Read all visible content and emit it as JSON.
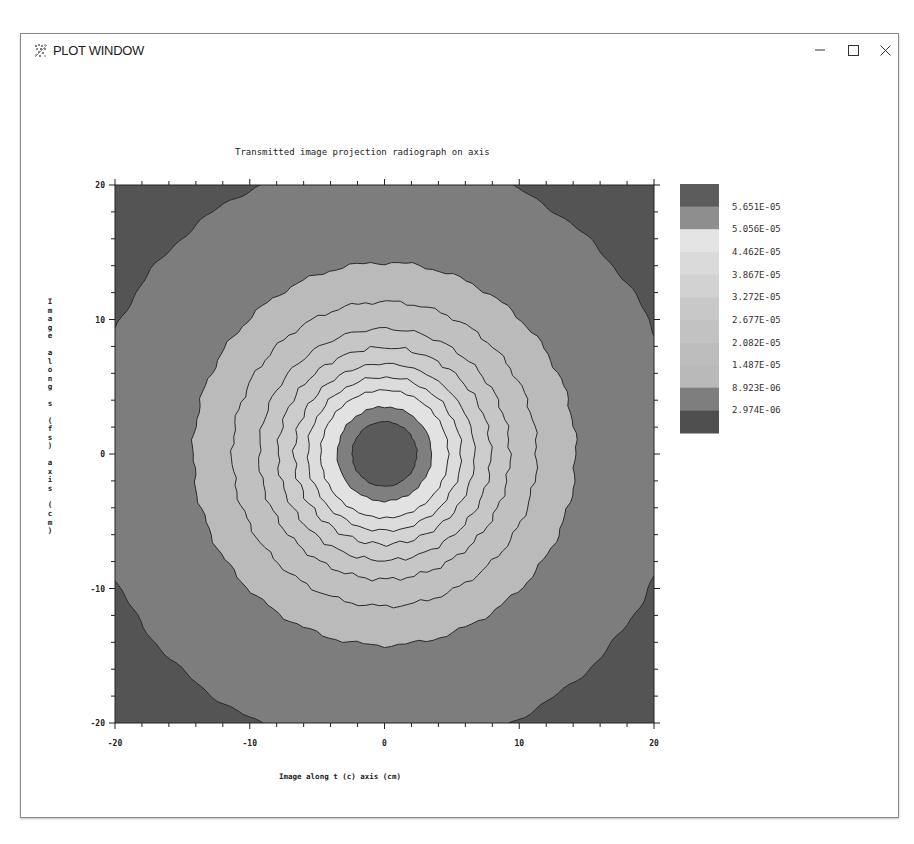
{
  "window": {
    "title": "PLOT WINDOW",
    "icon": "app-plot-icon",
    "controls": {
      "minimize": "minimize-icon",
      "maximize": "maximize-icon",
      "close": "close-icon"
    }
  },
  "chart_data": {
    "type": "heatmap",
    "subtype": "filled-contour",
    "title": "Transmitted image projection radiograph on axis",
    "xlabel": "Image along t (c) axis (cm)",
    "ylabel": "Image along s (fs) axis (cm)",
    "xlim": [
      -20,
      20
    ],
    "ylim": [
      -20,
      20
    ],
    "xticks": [
      -20,
      -10,
      0,
      10,
      20
    ],
    "yticks": [
      -20,
      -10,
      0,
      10,
      20
    ],
    "grid": false,
    "legend_position": "right",
    "colorbar": {
      "levels": [
        "5.651E-05",
        "5.056E-05",
        "4.462E-05",
        "3.867E-05",
        "3.272E-05",
        "2.677E-05",
        "2.082E-05",
        "1.487E-05",
        "8.923E-06",
        "2.974E-06"
      ],
      "level_values": [
        5.651e-05,
        5.056e-05,
        4.462e-05,
        3.867e-05,
        3.272e-05,
        2.677e-05,
        2.082e-05,
        1.487e-05,
        8.923e-06,
        2.974e-06
      ],
      "band_colors": [
        "#5c5c5c",
        "#8e8e8e",
        "#e4e4e4",
        "#dadada",
        "#d2d2d2",
        "#c8c8c8",
        "#c2c2c2",
        "#bdbdbd",
        "#b9b9b9",
        "#7e7e7e",
        "#4e4e4e"
      ]
    },
    "center": [
      0,
      0
    ],
    "rings": [
      {
        "outer_radius_cm": 2.4,
        "color": "#5a5a5a",
        "label": "center core"
      },
      {
        "outer_radius_cm": 3.5,
        "color": "#7f7f7f"
      },
      {
        "outer_radius_cm": 4.7,
        "color": "#e2e2e2"
      },
      {
        "outer_radius_cm": 5.7,
        "color": "#dcdcdc"
      },
      {
        "outer_radius_cm": 6.7,
        "color": "#d4d4d4"
      },
      {
        "outer_radius_cm": 7.9,
        "color": "#cccccc"
      },
      {
        "outer_radius_cm": 9.3,
        "color": "#c6c6c6"
      },
      {
        "outer_radius_cm": 11.3,
        "color": "#c0c0c0"
      },
      {
        "outer_radius_cm": 14.2,
        "color": "#bababa"
      },
      {
        "outer_radius_cm": 22.0,
        "color": "#7d7d7d"
      },
      {
        "outer_radius_cm": 40.0,
        "color": "#545454",
        "label": "corners"
      }
    ]
  }
}
